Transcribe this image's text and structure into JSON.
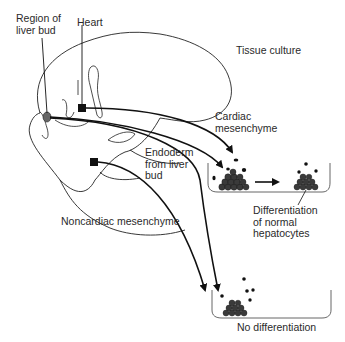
{
  "labels": {
    "region_of_liver_bud": "Region of\nliver bud",
    "heart": "Heart",
    "tissue_culture": "Tissue culture",
    "cardiac_mesenchyme": "Cardiac\nmesenchyme",
    "endoderm_from_liver_bud": "Endoderm\nfrom liver\nbud",
    "noncardiac_mesenchyme": "Noncardiac mesenchyme",
    "differentiation_of_normal_hepatocytes": "Differentiation\nof normal\nhepatocytes",
    "no_differentiation": "No differentiation"
  },
  "colors": {
    "line": "#111111",
    "cell": "#3a3a3a",
    "text": "#2a2a2a",
    "dish": "#555555"
  }
}
